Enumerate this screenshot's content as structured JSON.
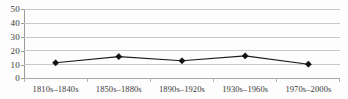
{
  "chart_data": {
    "type": "line",
    "title": "",
    "xlabel": "",
    "ylabel": "",
    "categories": [
      "1810s–1840s",
      "1850s–1880s",
      "1890s–1920s",
      "1930s–1960s",
      "1970s–2000s"
    ],
    "values": [
      11,
      15.5,
      12.5,
      16,
      10
    ],
    "series": [
      {
        "name": "",
        "values": [
          11,
          15.5,
          12.5,
          16,
          10
        ]
      }
    ],
    "ylim": [
      0,
      50
    ],
    "yticks": [
      0,
      10,
      20,
      30,
      40,
      50
    ],
    "ytick_labels": [
      "0",
      "10",
      "20",
      "30",
      "40",
      "50"
    ],
    "grid": true,
    "grid_axis": "y",
    "legend": false,
    "legend_position": "none",
    "marker": "diamond",
    "marker_color": "#111111",
    "line_color": "#1b1b1b",
    "gridline_color": "#c9c9c9",
    "background_color": "#fdfdfd"
  },
  "axis": {
    "y_labels": [
      "50",
      "40",
      "30",
      "20",
      "10",
      "0"
    ],
    "x_labels": [
      "1810s–1840s",
      "1850s–1880s",
      "1890s–1920s",
      "1930s–1960s",
      "1970s–2000s"
    ]
  }
}
